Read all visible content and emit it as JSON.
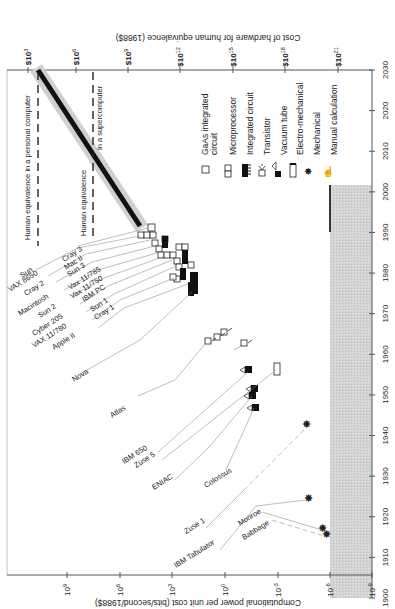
{
  "chart_data": {
    "type": "scatter",
    "orientation": "rotated 90deg (year axis vertical on right, read bottom-to-top)",
    "title": "",
    "xlabel": "Year",
    "ylabel": "Computational power per unit cost (bits/second/1988$)",
    "y2label": "Cost of hardware for human equivalence (1988$)",
    "x_ticks": [
      "1900",
      "1910",
      "1920",
      "1930",
      "1940",
      "1950",
      "1960",
      "1970",
      "1980",
      "1990",
      "2000",
      "2010",
      "2020",
      "2030"
    ],
    "y_ticks": [
      "10^-9",
      "10^-6",
      "10^-3",
      "10^0",
      "10^3",
      "10^6",
      "10^9"
    ],
    "y2_ticks": [
      "$10^21",
      "$10^18",
      "$10^15",
      "$10^12",
      "$10^9",
      "$10^6",
      "$10^3"
    ],
    "xlim": [
      1900,
      2030
    ],
    "ylim_log10": [
      -9,
      12
    ],
    "legend": [
      {
        "symbol": "open-square",
        "label": "GaAs integrated circuit"
      },
      {
        "symbol": "double-square",
        "label": "Microprocessor"
      },
      {
        "symbol": "filled-comb",
        "label": "Integrated circuit"
      },
      {
        "symbol": "transistor",
        "label": "Transistor"
      },
      {
        "symbol": "vacuum-tube",
        "label": "Vacuum tube"
      },
      {
        "symbol": "relay",
        "label": "Electro-mechanical"
      },
      {
        "symbol": "star",
        "label": "Mechanical"
      },
      {
        "symbol": "hand",
        "label": "Manual calculation"
      }
    ],
    "annotations": [
      "Human equivalence in a personal computer",
      "Human equivalence in a supercomputer"
    ],
    "series": [
      {
        "name": "Mechanical",
        "points": [
          {
            "label": "Babbage",
            "year": 1910,
            "log10_power": -5.6
          },
          {
            "label": "Monroe",
            "year": 1911,
            "log10_power": -5.4
          },
          {
            "label": "IBM Tabulator",
            "year": 1919,
            "log10_power": -4.9
          },
          {
            "label": "Zuse 1",
            "year": 1938,
            "log10_power": -4.9
          }
        ]
      },
      {
        "name": "Electro-mechanical / Vacuum tube",
        "points": [
          {
            "label": "Colossus",
            "year": 1943,
            "log10_power": -2.0
          },
          {
            "label": "ENIAC",
            "year": 1946,
            "log10_power": -2.1
          },
          {
            "label": "Zuse 5",
            "year": 1952,
            "log10_power": -5.3
          },
          {
            "label": "IBM 650",
            "year": 1953,
            "log10_power": -1.4
          }
        ]
      },
      {
        "name": "Transistor",
        "points": [
          {
            "label": "Atlas",
            "year": 1959,
            "log10_power": -0.3
          },
          {
            "label": "",
            "year": 1960,
            "log10_power": -1.5
          },
          {
            "label": "",
            "year": 1961,
            "log10_power": 0.1
          },
          {
            "label": "",
            "year": 1962,
            "log10_power": 0.5
          }
        ]
      },
      {
        "name": "Integrated circuit / Microprocessor",
        "points": [
          {
            "label": "Nova",
            "year": 1973,
            "log10_power": 1.2
          },
          {
            "label": "Apple II",
            "year": 1977,
            "log10_power": 1.6
          },
          {
            "label": "VAX 11/780",
            "year": 1978,
            "log10_power": 2.4
          },
          {
            "label": "Cray 1",
            "year": 1977,
            "log10_power": 2.6
          },
          {
            "label": "Cyber 205",
            "year": 1980,
            "log10_power": 2.5
          },
          {
            "label": "Sun 1",
            "year": 1980,
            "log10_power": 2.2
          },
          {
            "label": "IBM PC",
            "year": 1981,
            "log10_power": 2.2
          },
          {
            "label": "Sun 2",
            "year": 1982,
            "log10_power": 2.0
          },
          {
            "label": "Vax 11/750",
            "year": 1983,
            "log10_power": 2.9
          },
          {
            "label": "Macintosh",
            "year": 1984,
            "log10_power": 2.3
          },
          {
            "label": "Vax 11/785",
            "year": 1985,
            "log10_power": 3.0
          },
          {
            "label": "Cray 2",
            "year": 1985,
            "log10_power": 3.8
          },
          {
            "label": "Sun 3",
            "year": 1986,
            "log10_power": 3.5
          },
          {
            "label": "VAX 8650",
            "year": 1986,
            "log10_power": 3.2
          },
          {
            "label": "Mac II",
            "year": 1987,
            "log10_power": 4.1
          },
          {
            "label": "Sun",
            "year": 1988,
            "log10_power": 4.5
          },
          {
            "label": "Cray 3",
            "year": 1989,
            "log10_power": 4.7
          }
        ]
      },
      {
        "name": "Trend (projection)",
        "points": [
          {
            "year": 1990,
            "log10_power": 5.0
          },
          {
            "year": 2010,
            "log10_power": 8.9
          },
          {
            "year": 2030,
            "log10_power": 12.0
          }
        ]
      }
    ],
    "shaded_region": {
      "label": "Manual calculation",
      "x": [
        1900,
        2000
      ],
      "log10_power": [
        -9,
        -6
      ]
    },
    "grid": false,
    "legend_position": "upper middle"
  },
  "axis": {
    "bottom_title": "Computational power per unit cost (bits/second/1988$)",
    "top_title": "Cost of hardware for human equivalence (1988$)",
    "year_ticks": [
      "1900",
      "1910",
      "1920",
      "1930",
      "1940",
      "1950",
      "1960",
      "1970",
      "1980",
      "1990",
      "2000",
      "2010",
      "2020",
      "2030"
    ],
    "power_ticks": [
      {
        "base": "10",
        "exp": "9"
      },
      {
        "base": "10",
        "exp": "6"
      },
      {
        "base": "10",
        "exp": "3"
      },
      {
        "base": "10",
        "exp": "0"
      },
      {
        "base": "10",
        "exp": "-3"
      },
      {
        "base": "10",
        "exp": "-6"
      },
      {
        "base": "10",
        "exp": "-9"
      }
    ],
    "cost_ticks": [
      {
        "base": "$10",
        "exp": "3"
      },
      {
        "base": "$10",
        "exp": "6"
      },
      {
        "base": "$10",
        "exp": "9"
      },
      {
        "base": "$10",
        "exp": "12"
      },
      {
        "base": "$10",
        "exp": "15"
      },
      {
        "base": "$10",
        "exp": "18"
      },
      {
        "base": "$10",
        "exp": "21"
      }
    ]
  },
  "legend": {
    "items": [
      "GaAs integrated",
      "circuit",
      "Microprocessor",
      "Integrated circuit",
      "Transistor",
      "Vacuum tube",
      "Electro-mechanical",
      "Mechanical",
      "Manual calculation"
    ]
  },
  "annotations": {
    "pc": "Human equivalence in a personal computer",
    "super_a": "Human equivalence",
    "super_b": "in a supercomputer"
  },
  "machines": {
    "cluster": [
      "Sun",
      "VAX 8650",
      "Cray 2",
      "Macintosh",
      "Sun 2",
      "Cyber 205",
      "VAX 11/780",
      "Apple II"
    ],
    "cluster2": [
      "Cray 3",
      "Mac II",
      "Sun 3",
      "Vax 11/785",
      "Vax 11/750",
      "IBM PC",
      "Sun 1",
      "Cray 1"
    ],
    "nova": "Nova",
    "atlas": "Atlas",
    "ibm650": "IBM 650",
    "zuse5": "Zuse 5",
    "eniac": "ENIAC",
    "colossus": "Colossus",
    "zuse1": "Zuse 1",
    "ibmtab": "IBM Tabulator",
    "monroe": "Monroe",
    "babbage": "Babbage"
  }
}
